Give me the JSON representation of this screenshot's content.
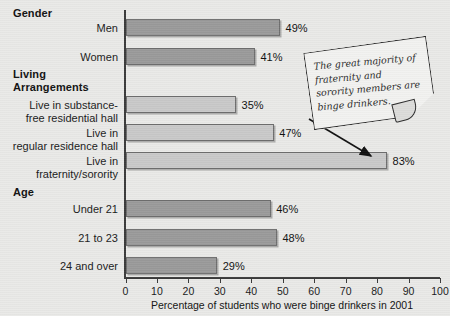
{
  "chart_data": {
    "type": "bar",
    "orientation": "horizontal",
    "title": "",
    "xlabel": "Percentage of students who were binge drinkers in 2001",
    "ylabel": "",
    "xlim": [
      0,
      100
    ],
    "xticks": [
      0,
      10,
      20,
      30,
      40,
      50,
      60,
      70,
      80,
      90,
      100
    ],
    "grid": false,
    "legend": "none",
    "groups": [
      {
        "header": "Gender",
        "bar_color": "#9a9a9a",
        "bars": [
          {
            "label": "Men",
            "value": 49,
            "value_label": "49%"
          },
          {
            "label": "Women",
            "value": 41,
            "value_label": "41%"
          }
        ]
      },
      {
        "header": "Living\nArrangements",
        "bar_color": "#c9c9c9",
        "bars": [
          {
            "label": "Live in substance-\nfree residential hall",
            "value": 35,
            "value_label": "35%"
          },
          {
            "label": "Live in\nregular residence hall",
            "value": 47,
            "value_label": "47%"
          },
          {
            "label": "Live in\nfraternity/sorority",
            "value": 83,
            "value_label": "83%"
          }
        ]
      },
      {
        "header": "Age",
        "bar_color": "#9a9a9a",
        "bars": [
          {
            "label": "Under 21",
            "value": 46,
            "value_label": "46%"
          },
          {
            "label": "21 to 23",
            "value": 48,
            "value_label": "48%"
          },
          {
            "label": "24 and over",
            "value": 29,
            "value_label": "29%"
          }
        ]
      }
    ],
    "categories": [
      "Men",
      "Women",
      "Live in substance-free residential hall",
      "Live in regular residence hall",
      "Live in fraternity/sorority",
      "Under 21",
      "21 to 23",
      "24 and over"
    ],
    "values": [
      49,
      41,
      35,
      47,
      83,
      46,
      48,
      29
    ],
    "annotations": [
      {
        "text": "The great majority of fraternity and sorority members are binge drinkers.",
        "points_to": "Live in fraternity/sorority",
        "style": "sticky-note"
      }
    ]
  },
  "colors": {
    "background": "#e9e9e7",
    "bar_dark": "#9a9a9a",
    "bar_light": "#c9c9c9",
    "bar_border": "#6e6e6e",
    "axis": "#3a3a3a",
    "text": "#1a1a1a"
  }
}
